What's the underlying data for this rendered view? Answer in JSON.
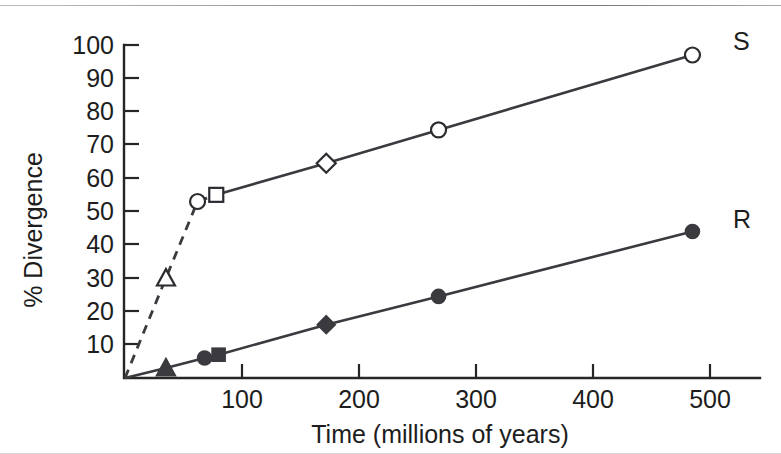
{
  "chart_data": {
    "type": "line",
    "title": "",
    "xlabel": "Time (millions of years)",
    "ylabel": "% Divergence",
    "xlim": [
      0,
      520
    ],
    "ylim": [
      0,
      100
    ],
    "xticks": [
      100,
      200,
      300,
      400,
      500
    ],
    "yticks": [
      10,
      20,
      30,
      40,
      50,
      60,
      70,
      80,
      90,
      100
    ],
    "grid": false,
    "legend_position": "inline-right-of-last-point",
    "series": [
      {
        "name": "S",
        "label": "S",
        "style": "solid-with-dashed-lead",
        "marker_fill": "open",
        "points": [
          {
            "x": 0,
            "y": 0,
            "marker": "none",
            "segment": "dashed"
          },
          {
            "x": 35,
            "y": 30,
            "marker": "triangle",
            "segment": "dashed"
          },
          {
            "x": 62,
            "y": 53,
            "marker": "circle",
            "segment": "dashed"
          },
          {
            "x": 78,
            "y": 55,
            "marker": "square",
            "segment": "solid"
          },
          {
            "x": 172,
            "y": 64.5,
            "marker": "diamond",
            "segment": "solid"
          },
          {
            "x": 268,
            "y": 74.5,
            "marker": "circle",
            "segment": "solid"
          },
          {
            "x": 485,
            "y": 97,
            "marker": "circle",
            "segment": "solid"
          }
        ]
      },
      {
        "name": "R",
        "label": "R",
        "style": "solid",
        "marker_fill": "filled",
        "points": [
          {
            "x": 0,
            "y": 0,
            "marker": "none",
            "segment": "solid"
          },
          {
            "x": 35,
            "y": 3,
            "marker": "triangle",
            "segment": "solid"
          },
          {
            "x": 68,
            "y": 6,
            "marker": "circle",
            "segment": "solid"
          },
          {
            "x": 80,
            "y": 7,
            "marker": "square",
            "segment": "solid"
          },
          {
            "x": 172,
            "y": 16,
            "marker": "diamond",
            "segment": "solid"
          },
          {
            "x": 268,
            "y": 24.5,
            "marker": "circle",
            "segment": "solid"
          },
          {
            "x": 485,
            "y": 44,
            "marker": "circle",
            "segment": "solid"
          }
        ]
      }
    ]
  },
  "axes": {
    "y_tick_labels": [
      "100",
      "90",
      "80",
      "70",
      "60",
      "50",
      "40",
      "30",
      "20",
      "10"
    ],
    "x_tick_labels": [
      "100",
      "200",
      "300",
      "400",
      "500"
    ],
    "x_title": "Time (millions of years)",
    "y_title": "% Divergence"
  },
  "series_labels": {
    "upper": "S",
    "lower": "R"
  },
  "colors": {
    "ink": "#2b2b30",
    "line": "#3a3a3f",
    "background": "#ffffff"
  }
}
